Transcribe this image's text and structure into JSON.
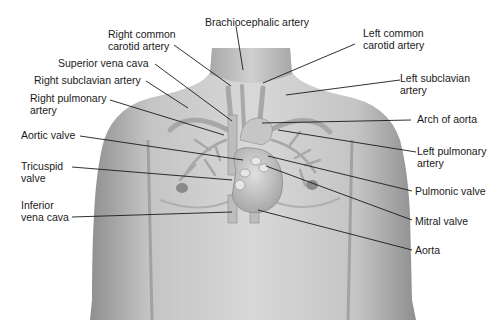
{
  "diagram": {
    "labels": {
      "brachiocephalic_artery": "Brachiocephalic artery",
      "right_common_carotid_1": "Right common",
      "right_common_carotid_2": "carotid artery",
      "left_common_carotid_1": "Left common",
      "left_common_carotid_2": "carotid artery",
      "superior_vena_cava": "Superior vena cava",
      "right_subclavian_artery": "Right subclavian artery",
      "left_subclavian_1": "Left subclavian",
      "left_subclavian_2": "artery",
      "right_pulmonary_1": "Right pulmonary",
      "right_pulmonary_2": "artery",
      "arch_of_aorta": "Arch of aorta",
      "aortic_valve": "Aortic valve",
      "left_pulmonary_1": "Left pulmonary",
      "left_pulmonary_2": "artery",
      "tricuspid_1": "Tricuspid",
      "tricuspid_2": "valve",
      "pulmonic_valve": "Pulmonic valve",
      "inferior_vena_cava_1": "Inferior",
      "inferior_vena_cava_2": "vena cava",
      "mitral_valve": "Mitral valve",
      "aorta": "Aorta"
    },
    "colors": {
      "skin_light": "#d6d6d6",
      "skin_dark": "#9a9a9a",
      "vessel": "#b8b8b8",
      "leader_line": "#1a1a1a",
      "text": "#1a1a1a"
    }
  }
}
